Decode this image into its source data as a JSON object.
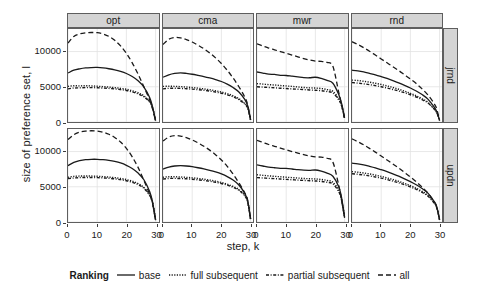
{
  "chart_data": {
    "type": "line",
    "title": "",
    "xlabel": "step, k",
    "ylabel": "size of preference set, l",
    "xlim": [
      0,
      31
    ],
    "ylim": [
      0,
      13200
    ],
    "xticks": [
      0,
      10,
      20,
      30
    ],
    "yticks": [
      0,
      5000,
      10000
    ],
    "ytick_labels": [
      "0",
      "5000",
      "10000"
    ],
    "xtick_labels": [
      "0",
      "10",
      "20",
      "30"
    ],
    "grid": true,
    "legend_position": "bottom",
    "legend_title": "Ranking",
    "col_facets": [
      "opt",
      "cma",
      "mwr",
      "rnd"
    ],
    "row_facets": [
      "jrnd",
      "updn"
    ],
    "series_names": [
      "base",
      "full subsequent",
      "partial subsequent",
      "all"
    ],
    "series_styles": [
      "solid",
      "dotted",
      "dash-dot",
      "dashed"
    ],
    "color": "#1a1a1a",
    "panels": [
      {
        "row": "jrnd",
        "col": "opt",
        "x": [
          0,
          2,
          4,
          6,
          8,
          10,
          12,
          14,
          16,
          18,
          20,
          22,
          24,
          26,
          28,
          29,
          30
        ],
        "series": [
          {
            "name": "base",
            "values": [
              6950,
              7350,
              7550,
              7680,
              7730,
              7740,
              7680,
              7560,
              7400,
              7180,
              6880,
              6450,
              5850,
              4950,
              3450,
              2100,
              200
            ]
          },
          {
            "name": "full subsequent",
            "values": [
              5050,
              5150,
              5130,
              5150,
              5120,
              5080,
              5020,
              4960,
              4880,
              4780,
              4640,
              4440,
              4150,
              3700,
              2900,
              2000,
              180
            ]
          },
          {
            "name": "partial subsequent",
            "values": [
              4700,
              4820,
              4850,
              4880,
              4880,
              4860,
              4820,
              4770,
              4700,
              4600,
              4470,
              4280,
              4000,
              3580,
              2820,
              1950,
              170
            ]
          },
          {
            "name": "all",
            "values": [
              11200,
              12150,
              12500,
              12650,
              12700,
              12680,
              12500,
              12150,
              11600,
              10800,
              9750,
              8400,
              6800,
              5000,
              3100,
              1800,
              150
            ]
          }
        ]
      },
      {
        "row": "jrnd",
        "col": "cma",
        "x": [
          0,
          2,
          4,
          6,
          8,
          10,
          12,
          14,
          16,
          18,
          20,
          22,
          24,
          26,
          28,
          29,
          30
        ],
        "series": [
          {
            "name": "base",
            "values": [
              6350,
              6700,
              6900,
              6980,
              6900,
              6780,
              6620,
              6450,
              6250,
              6020,
              5750,
              5380,
              4900,
              4250,
              3200,
              2300,
              350
            ]
          },
          {
            "name": "full subsequent",
            "values": [
              5050,
              5080,
              5060,
              5020,
              4960,
              4890,
              4800,
              4700,
              4580,
              4430,
              4250,
              4020,
              3720,
              3300,
              2650,
              2050,
              330
            ]
          },
          {
            "name": "partial subsequent",
            "values": [
              4700,
              4780,
              4790,
              4770,
              4730,
              4670,
              4590,
              4500,
              4390,
              4250,
              4080,
              3860,
              3580,
              3180,
              2560,
              1980,
              320
            ]
          },
          {
            "name": "all",
            "values": [
              11000,
              11750,
              12000,
              11950,
              11700,
              11350,
              10900,
              10400,
              9800,
              9100,
              8300,
              7350,
              6250,
              5000,
              3550,
              2450,
              300
            ]
          }
        ]
      },
      {
        "row": "jrnd",
        "col": "mwr",
        "x": [
          0,
          2,
          4,
          6,
          8,
          10,
          12,
          14,
          16,
          18,
          20,
          22,
          24,
          26,
          28,
          29,
          30
        ],
        "series": [
          {
            "name": "base",
            "values": [
              7100,
              6950,
              6800,
              6750,
              6620,
              6600,
              6500,
              6400,
              6300,
              6280,
              6350,
              6180,
              5900,
              5500,
              3900,
              2600,
              600
            ]
          },
          {
            "name": "full subsequent",
            "values": [
              5450,
              5380,
              5300,
              5250,
              5180,
              5120,
              5050,
              4980,
              4900,
              4850,
              4820,
              4750,
              4600,
              4350,
              3300,
              2350,
              560
            ]
          },
          {
            "name": "partial subsequent",
            "values": [
              5000,
              4950,
              4900,
              4850,
              4800,
              4750,
              4700,
              4650,
              4600,
              4550,
              4500,
              4440,
              4320,
              4100,
              3150,
              2250,
              540
            ]
          },
          {
            "name": "all",
            "values": [
              11100,
              10800,
              10500,
              10250,
              10000,
              9750,
              9500,
              9250,
              9000,
              8800,
              8650,
              8600,
              8450,
              7900,
              4200,
              2400,
              500
            ]
          }
        ]
      },
      {
        "row": "jrnd",
        "col": "rnd",
        "x": [
          0,
          2,
          4,
          6,
          8,
          10,
          12,
          14,
          16,
          18,
          20,
          22,
          24,
          26,
          28,
          29,
          30
        ],
        "series": [
          {
            "name": "base",
            "values": [
              7350,
              7250,
              7100,
              6900,
              6700,
              6450,
              6180,
              5880,
              5560,
              5200,
              4820,
              4400,
              3900,
              3250,
              2200,
              1500,
              250
            ]
          },
          {
            "name": "full subsequent",
            "values": [
              5950,
              5880,
              5780,
              5650,
              5500,
              5320,
              5120,
              4900,
              4650,
              4380,
              4070,
              3720,
              3300,
              2800,
              1950,
              1380,
              230
            ]
          },
          {
            "name": "partial subsequent",
            "values": [
              5600,
              5520,
              5420,
              5300,
              5160,
              5000,
              4820,
              4620,
              4400,
              4150,
              3870,
              3550,
              3170,
              2700,
              1900,
              1350,
              220
            ]
          },
          {
            "name": "all",
            "values": [
              11400,
              11000,
              10550,
              10050,
              9500,
              8950,
              8400,
              7850,
              7300,
              6700,
              6100,
              5450,
              4700,
              3850,
              2700,
              1900,
              200
            ]
          }
        ]
      },
      {
        "row": "updn",
        "col": "opt",
        "x": [
          0,
          2,
          4,
          6,
          8,
          10,
          12,
          14,
          16,
          18,
          20,
          22,
          24,
          26,
          28,
          29,
          30
        ],
        "series": [
          {
            "name": "base",
            "values": [
              8000,
              8450,
              8700,
              8850,
              8900,
              8900,
              8850,
              8750,
              8600,
              8380,
              8050,
              7600,
              6950,
              6000,
              4300,
              2800,
              300
            ]
          },
          {
            "name": "full subsequent",
            "values": [
              6350,
              6480,
              6520,
              6530,
              6520,
              6490,
              6440,
              6380,
              6300,
              6180,
              6020,
              5800,
              5450,
              4900,
              3850,
              2700,
              280
            ]
          },
          {
            "name": "partial subsequent",
            "values": [
              6150,
              6250,
              6300,
              6320,
              6320,
              6300,
              6260,
              6200,
              6120,
              6010,
              5860,
              5640,
              5310,
              4780,
              3760,
              2650,
              270
            ]
          },
          {
            "name": "all",
            "values": [
              11700,
              12400,
              12750,
              12900,
              12950,
              12900,
              12750,
              12450,
              12000,
              11350,
              10450,
              9250,
              7750,
              5900,
              3900,
              2500,
              250
            ]
          }
        ]
      },
      {
        "row": "updn",
        "col": "cma",
        "x": [
          0,
          2,
          4,
          6,
          8,
          10,
          12,
          14,
          16,
          18,
          20,
          22,
          24,
          26,
          28,
          29,
          30
        ],
        "series": [
          {
            "name": "base",
            "values": [
              7500,
              7800,
              7950,
              8000,
              7950,
              7850,
              7700,
              7530,
              7330,
              7100,
              6820,
              6450,
              5950,
              5250,
              4050,
              3000,
              450
            ]
          },
          {
            "name": "full subsequent",
            "values": [
              6350,
              6420,
              6420,
              6390,
              6340,
              6270,
              6180,
              6080,
              5950,
              5800,
              5610,
              5370,
              5050,
              4600,
              3800,
              2900,
              430
            ]
          },
          {
            "name": "partial subsequent",
            "values": [
              6100,
              6180,
              6190,
              6170,
              6130,
              6070,
              5990,
              5900,
              5780,
              5640,
              5460,
              5230,
              4930,
              4500,
              3720,
              2850,
              420
            ]
          },
          {
            "name": "all",
            "values": [
              11500,
              12050,
              12250,
              12200,
              11980,
              11650,
              11230,
              10750,
              10200,
              9550,
              8800,
              7900,
              6800,
              5550,
              4150,
              3100,
              400
            ]
          }
        ]
      },
      {
        "row": "updn",
        "col": "mwr",
        "x": [
          0,
          2,
          4,
          6,
          8,
          10,
          12,
          14,
          16,
          18,
          20,
          22,
          24,
          26,
          28,
          29,
          30
        ],
        "series": [
          {
            "name": "base",
            "values": [
              8100,
              7950,
              7800,
              7700,
              7620,
              7600,
              7520,
              7420,
              7350,
              7330,
              7380,
              7220,
              6950,
              6500,
              5000,
              3400,
              700
            ]
          },
          {
            "name": "full subsequent",
            "values": [
              6700,
              6620,
              6550,
              6480,
              6420,
              6360,
              6300,
              6240,
              6180,
              6140,
              6110,
              6040,
              5900,
              5650,
              4500,
              3200,
              670
            ]
          },
          {
            "name": "partial subsequent",
            "values": [
              6300,
              6250,
              6200,
              6150,
              6100,
              6050,
              6000,
              5950,
              5900,
              5860,
              5820,
              5760,
              5640,
              5400,
              4300,
              3050,
              650
            ]
          },
          {
            "name": "all",
            "values": [
              11600,
              11300,
              11000,
              10750,
              10500,
              10250,
              10000,
              9780,
              9550,
              9380,
              9250,
              9200,
              9050,
              8500,
              5200,
              3000,
              600
            ]
          }
        ]
      },
      {
        "row": "updn",
        "col": "rnd",
        "x": [
          0,
          2,
          4,
          6,
          8,
          10,
          12,
          14,
          16,
          18,
          20,
          22,
          24,
          26,
          28,
          29,
          30
        ],
        "series": [
          {
            "name": "base",
            "values": [
              8350,
              8250,
              8100,
              7900,
              7680,
              7420,
              7140,
              6830,
              6500,
              6130,
              5730,
              5280,
              4760,
              4100,
              3000,
              2200,
              350
            ]
          },
          {
            "name": "full subsequent",
            "values": [
              7150,
              7070,
              6960,
              6820,
              6660,
              6470,
              6260,
              6030,
              5770,
              5480,
              5160,
              4790,
              4350,
              3800,
              2850,
              2100,
              330
            ]
          },
          {
            "name": "partial subsequent",
            "values": [
              6850,
              6770,
              6670,
              6540,
              6390,
              6220,
              6020,
              5800,
              5560,
              5290,
              4980,
              4630,
              4210,
              3680,
              2770,
              2050,
              320
            ]
          },
          {
            "name": "all",
            "values": [
              11800,
              11400,
              10950,
              10450,
              9920,
              9370,
              8800,
              8230,
              7650,
              7030,
              6400,
              5720,
              4960,
              4100,
              2950,
              2150,
              300
            ]
          }
        ]
      }
    ]
  }
}
